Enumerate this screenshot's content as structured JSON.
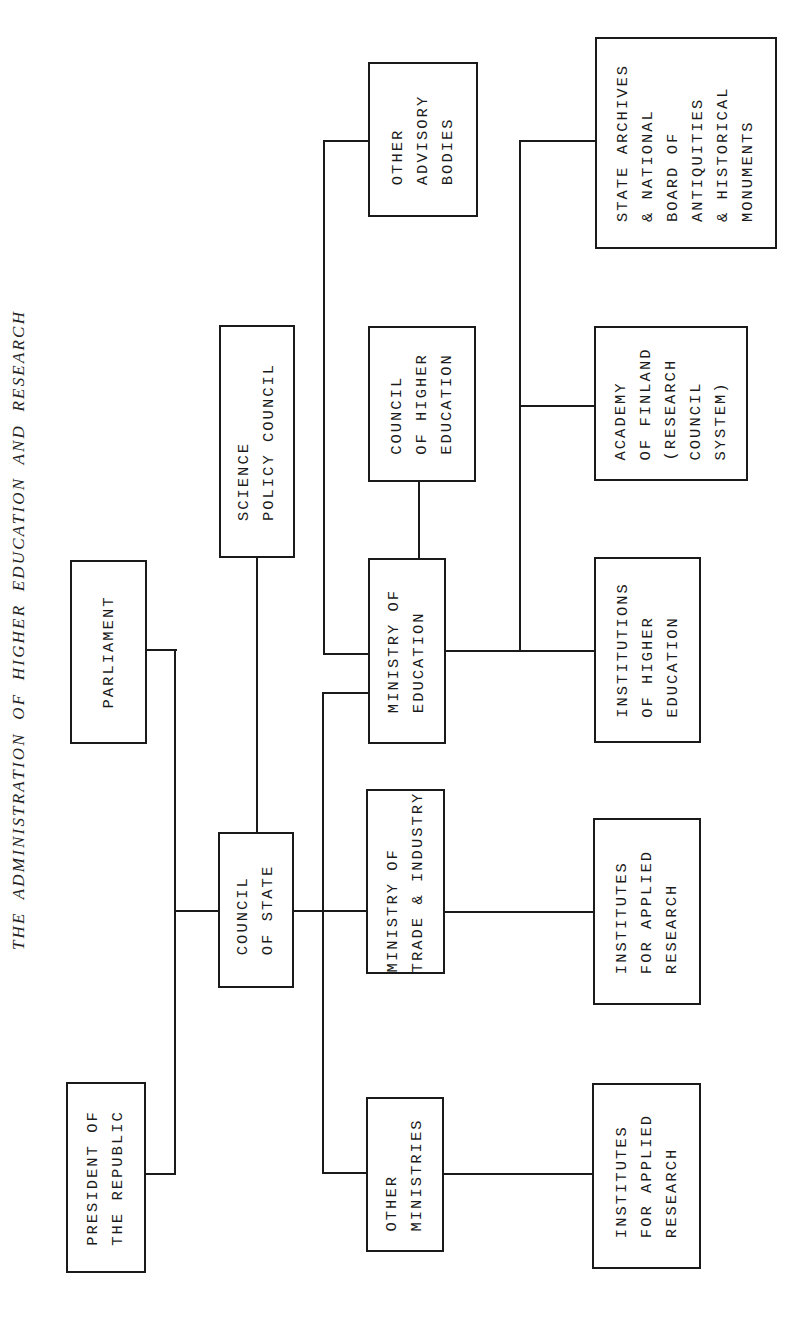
{
  "title": "THE ADMINISTRATION OF HIGHER EDUCATION AND RESEARCH",
  "nodes": {
    "president": "PRESIDENT OF\nTHE REPUBLIC",
    "parliament": "PARLIAMENT",
    "council_of_state": "COUNCIL\nOF STATE",
    "science_policy_council": "SCIENCE\nPOLICY COUNCIL",
    "other_ministries": "OTHER\nMINISTRIES",
    "ministry_trade_industry": "MINISTRY OF\nTRADE & INDUSTRY",
    "ministry_education": "MINISTRY OF\nEDUCATION",
    "council_higher_education": "COUNCIL\nOF HIGHER\nEDUCATION",
    "other_advisory_bodies": "OTHER\nADVISORY\nBODIES",
    "institutes_applied_research_1": "INSTITUTES\nFOR APPLIED\nRESEARCH",
    "institutes_applied_research_2": "INSTITUTES\nFOR APPLIED\nRESEARCH",
    "institutions_higher_education": "INSTITUTIONS\nOF HIGHER\nEDUCATION",
    "academy_of_finland": "ACADEMY\nOF FINLAND\n(RESEARCH\nCOUNCIL\nSYSTEM)",
    "state_archives": "STATE ARCHIVES\n& NATIONAL\nBOARD OF\nANTIQUITIES\n& HISTORICAL\nMONUMENTS"
  },
  "edges": [
    [
      "president",
      "council_of_state"
    ],
    [
      "parliament",
      "council_of_state"
    ],
    [
      "council_of_state",
      "science_policy_council"
    ],
    [
      "council_of_state",
      "other_ministries"
    ],
    [
      "council_of_state",
      "ministry_trade_industry"
    ],
    [
      "council_of_state",
      "ministry_education"
    ],
    [
      "ministry_education",
      "council_higher_education"
    ],
    [
      "ministry_education",
      "other_advisory_bodies"
    ],
    [
      "ministry_education",
      "institutions_higher_education"
    ],
    [
      "ministry_education",
      "academy_of_finland"
    ],
    [
      "ministry_education",
      "state_archives"
    ],
    [
      "ministry_trade_industry",
      "institutes_applied_research_2"
    ],
    [
      "other_ministries",
      "institutes_applied_research_1"
    ]
  ]
}
